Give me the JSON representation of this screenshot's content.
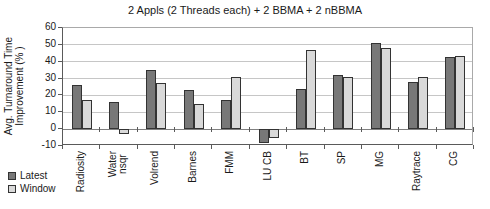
{
  "chart_data": {
    "type": "bar",
    "title": "2 Appls (2 Threads each) + 2 BBMA + 2 nBBMA",
    "ylabel": "Avg. Turnaround Time\nImprovement (% )",
    "xlabel": "",
    "categories": [
      "Radiosity",
      "Water\nnsqr",
      "Volrend",
      "Barnes",
      "FMM",
      "LU CB",
      "BT",
      "SP",
      "MG",
      "Raytrace",
      "CG"
    ],
    "series": [
      {
        "name": "Latest",
        "color": "#787878",
        "values": [
          26,
          16,
          35,
          23,
          17,
          -8,
          24,
          32,
          51,
          28,
          43
        ]
      },
      {
        "name": "Window",
        "color": "#d9d9d9",
        "values": [
          17.5,
          -3,
          27.5,
          15,
          31,
          -5,
          47,
          31,
          48,
          31,
          43.5
        ]
      }
    ],
    "ylim": [
      -10,
      60
    ],
    "yticks": [
      60,
      50,
      40,
      30,
      20,
      10,
      0,
      -10
    ],
    "grid": true,
    "legend_position": "bottom-left",
    "colors": {
      "gridline": "#c6c6c6",
      "zero_axis": "#808080",
      "bar_border": "#333333",
      "plot_border": "#a9a9a9",
      "text": "#1a1a1a"
    }
  }
}
